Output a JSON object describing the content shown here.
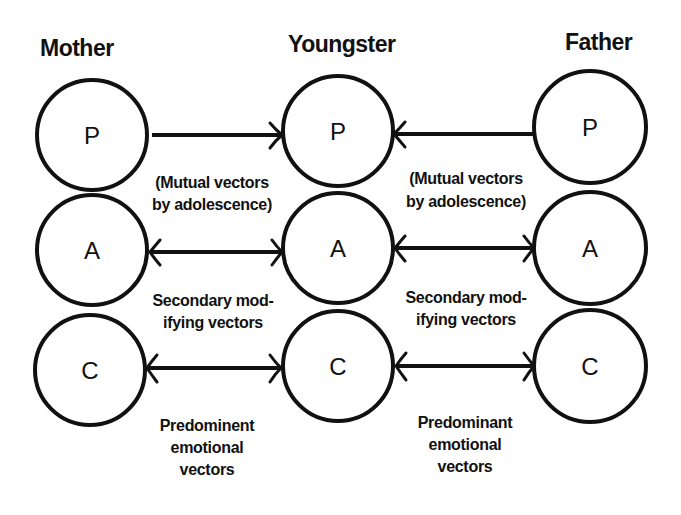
{
  "diagram": {
    "columns": [
      {
        "id": "mother",
        "title": "Mother",
        "nodes": [
          "P",
          "A",
          "C"
        ]
      },
      {
        "id": "youngster",
        "title": "Youngster",
        "nodes": [
          "P",
          "A",
          "C"
        ]
      },
      {
        "id": "father",
        "title": "Father",
        "nodes": [
          "P",
          "A",
          "C"
        ]
      }
    ],
    "left_labels": {
      "p_note_line1": "(Mutual vectors",
      "p_note_line2": "by adolescence)",
      "a_note_line1": "Secondary mod-",
      "a_note_line2": "ifying vectors",
      "c_note_line1": "Predominent",
      "c_note_line2": "emotional",
      "c_note_line3": "vectors"
    },
    "right_labels": {
      "p_note_line1": "(Mutual vectors",
      "p_note_line2": "by adolescence)",
      "a_note_line1": "Secondary mod-",
      "a_note_line2": "ifying vectors",
      "c_note_line1": "Predominant",
      "c_note_line2": "emotional",
      "c_note_line3": "vectors"
    },
    "edges": [
      {
        "from": "mother.P",
        "to": "youngster.P",
        "type": "one-way"
      },
      {
        "from": "father.P",
        "to": "youngster.P",
        "type": "one-way"
      },
      {
        "from": "mother.A",
        "to": "youngster.A",
        "type": "two-way"
      },
      {
        "from": "father.A",
        "to": "youngster.A",
        "type": "two-way"
      },
      {
        "from": "mother.C",
        "to": "youngster.C",
        "type": "two-way"
      },
      {
        "from": "father.C",
        "to": "youngster.C",
        "type": "two-way"
      }
    ],
    "colors": {
      "ink": "#111111",
      "background": "#ffffff"
    }
  }
}
